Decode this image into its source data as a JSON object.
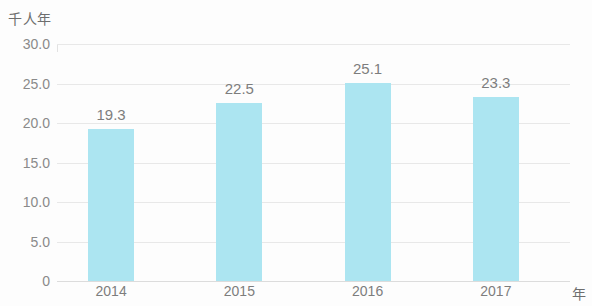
{
  "chart_data": {
    "type": "bar",
    "title": "",
    "subtitle": "",
    "xlabel": "年",
    "ylabel": "千人年",
    "categories": [
      "2014",
      "2015",
      "2016",
      "2017"
    ],
    "values": [
      19.3,
      22.5,
      25.1,
      23.3
    ],
    "value_labels": [
      "19.3",
      "22.5",
      "25.1",
      "23.3"
    ],
    "series": [
      {
        "name": "",
        "values": [
          19.3,
          22.5,
          25.1,
          23.3
        ]
      }
    ],
    "ylim": [
      0,
      30
    ],
    "yticks": [
      0,
      5,
      10,
      15,
      20,
      25,
      30
    ],
    "ytick_labels": [
      "0",
      "5.0",
      "10.0",
      "15.0",
      "20.0",
      "25.0",
      "30.0"
    ],
    "xtick_labels": [
      "2014",
      "2015",
      "2016",
      "2017"
    ],
    "grid": true,
    "grid_axis": "y",
    "legend": false,
    "legend_position": "none",
    "bar_color": "#ace5f1",
    "gridline_color": "#e8e8e8",
    "axis_text_color": "#8a8a8a",
    "background_color": "#fdfdfd"
  },
  "axes": {
    "y_unit_caption": "千人年",
    "x_unit_caption": "年"
  }
}
